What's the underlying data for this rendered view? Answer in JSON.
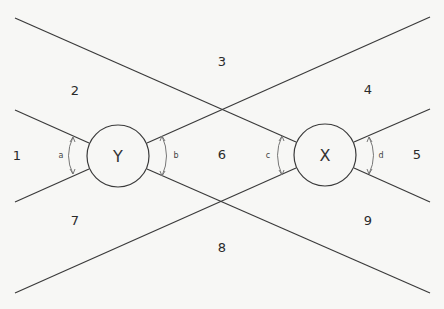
{
  "diagram": {
    "nodes": [
      {
        "id": "Y",
        "label": "Y",
        "cx": 118,
        "cy": 156,
        "r": 31
      },
      {
        "id": "X",
        "label": "X",
        "cx": 325,
        "cy": 155,
        "r": 31
      }
    ],
    "regions": [
      {
        "label": "1",
        "x": 17,
        "y": 156
      },
      {
        "label": "2",
        "x": 75,
        "y": 91
      },
      {
        "label": "3",
        "x": 222,
        "y": 62
      },
      {
        "label": "4",
        "x": 368,
        "y": 90
      },
      {
        "label": "5",
        "x": 417,
        "y": 155
      },
      {
        "label": "6",
        "x": 222,
        "y": 155
      },
      {
        "label": "7",
        "x": 75,
        "y": 221
      },
      {
        "label": "8",
        "x": 222,
        "y": 248
      },
      {
        "label": "9",
        "x": 368,
        "y": 221
      }
    ],
    "angles": [
      {
        "label": "a",
        "x": 61,
        "y": 155
      },
      {
        "label": "b",
        "x": 172,
        "y": 155
      },
      {
        "label": "c",
        "x": 270,
        "y": 155
      },
      {
        "label": "d",
        "x": 381,
        "y": 155
      }
    ],
    "colors": {
      "line": "#3a3a3a",
      "background": "#f7f7f5"
    }
  }
}
